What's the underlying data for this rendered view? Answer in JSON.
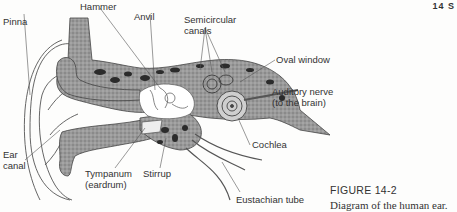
{
  "page": {
    "header_marker": "14  S"
  },
  "figure": {
    "number": "FIGURE 14-2",
    "caption": "Diagram of the human ear."
  },
  "labels": {
    "pinna": "Pinna",
    "hammer": "Hammer",
    "anvil": "Anvil",
    "semicircular_1": "Semicircular",
    "semicircular_2": "canals",
    "oval_window": "Oval window",
    "auditory_nerve_1": "Auditory nerve",
    "auditory_nerve_2": "(to the brain)",
    "cochlea": "Cochlea",
    "ear_canal_1": "Ear",
    "ear_canal_2": "canal",
    "tympanum_1": "Tympanum",
    "tympanum_2": "(eardrum)",
    "stirrup": "Stirrup",
    "eustachian_tube": "Eustachian tube"
  },
  "colors": {
    "tissue": "#8a8a8a",
    "bone_dark": "#2b2b2b",
    "outline": "#444444",
    "leader": "#555555"
  }
}
